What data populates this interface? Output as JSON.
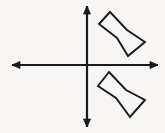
{
  "figure": {
    "title": "Coordinate axes with two chevron polygons",
    "background_color": "#f7f6f4",
    "ink_color": "#1a1a1a",
    "width": 165,
    "height": 133
  },
  "axes": {
    "origin": {
      "x": 86,
      "y": 65
    },
    "stroke_width": 2.2,
    "arrowhead_size": 5.5,
    "horizontal": {
      "label": "x-axis",
      "x1": 12,
      "y1": 65,
      "x2": 158,
      "y2": 65,
      "arrow_left": true,
      "arrow_right": true
    },
    "vertical": {
      "label": "y-axis",
      "x1": 87,
      "y1": 6,
      "x2": 87,
      "y2": 127,
      "arrow_top": true,
      "arrow_bottom": true
    }
  },
  "shapes": [
    {
      "name": "chevron-upper",
      "quadrant": "I",
      "stroke_width": 1.9,
      "closed": true,
      "points": "110,12 99,24 117,38 128,56 145,42 127,30"
    },
    {
      "name": "chevron-lower",
      "quadrant": "IV",
      "stroke_width": 1.9,
      "closed": true,
      "points": "109,72 98,86 116,98 130,117 145,100 126,90"
    }
  ],
  "arrowheads": [
    {
      "name": "x-axis-left-arrowhead",
      "points": "12,65 20,61.5 20,68.5"
    },
    {
      "name": "x-axis-right-arrowhead",
      "points": "158,65 150,61.5 150,68.5"
    },
    {
      "name": "y-axis-top-arrowhead",
      "points": "87,6 83.5,14 90.5,14"
    },
    {
      "name": "y-axis-bottom-arrowhead",
      "points": "87,127 83.5,119 90.5,119"
    }
  ]
}
